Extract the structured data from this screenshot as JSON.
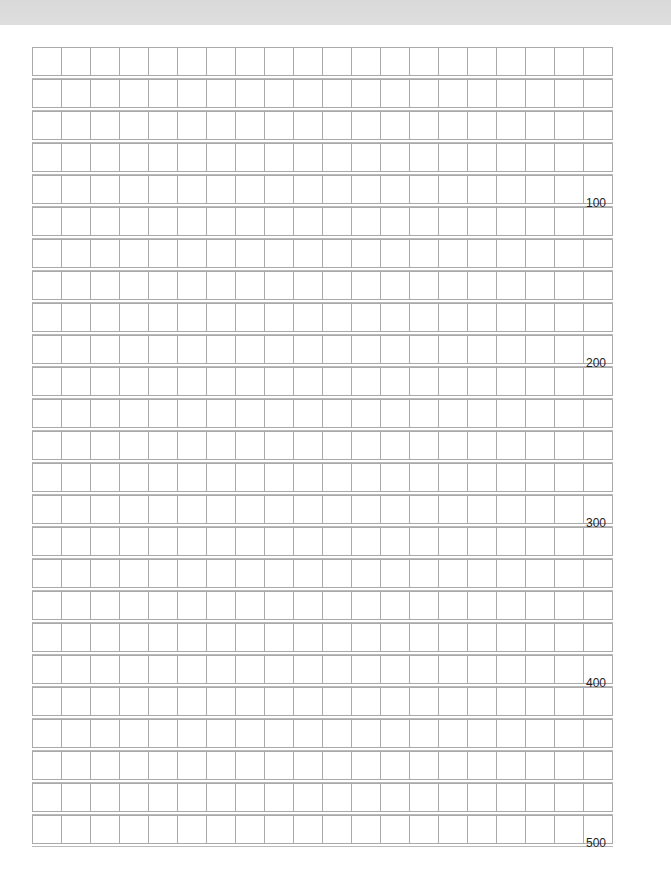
{
  "sheet": {
    "type": "manuscript-paper",
    "rows": 25,
    "columns": 20,
    "total_squares": 500,
    "row_counters": [
      {
        "row": 5,
        "label": "100"
      },
      {
        "row": 10,
        "label": "200"
      },
      {
        "row": 15,
        "label": "300"
      },
      {
        "row": 20,
        "label": "400"
      },
      {
        "row": 25,
        "label": "500"
      }
    ]
  },
  "colors": {
    "top_band": "#dcdcdc",
    "grid_line": "#a9a9a9",
    "background": "#ffffff",
    "text": "#222222"
  }
}
